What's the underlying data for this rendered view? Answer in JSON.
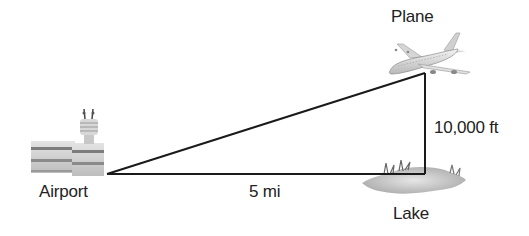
{
  "diagram": {
    "type": "right-triangle word problem",
    "labels": {
      "plane": "Plane",
      "airport": "Airport",
      "lake": "Lake",
      "horizontal_distance": "5 mi",
      "vertical_height": "10,000 ft"
    },
    "icons": {
      "airport": "airport-building-icon",
      "plane": "airplane-icon",
      "lake": "lake-icon"
    },
    "triangle": {
      "vertices": {
        "airport": [
          107,
          174
        ],
        "lake_right_angle": [
          425,
          174
        ],
        "plane": [
          425,
          73
        ]
      },
      "stroke_color": "#1a1a1a"
    }
  }
}
